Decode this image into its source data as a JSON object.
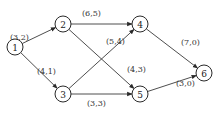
{
  "diagram": {
    "type": "directed-network",
    "nodes": [
      {
        "id": "1",
        "label": "1",
        "x": 15,
        "y": 47
      },
      {
        "id": "2",
        "label": "2",
        "x": 63,
        "y": 24
      },
      {
        "id": "3",
        "label": "3",
        "x": 63,
        "y": 94
      },
      {
        "id": "4",
        "label": "4",
        "x": 140,
        "y": 24
      },
      {
        "id": "5",
        "label": "5",
        "x": 140,
        "y": 94
      },
      {
        "id": "6",
        "label": "6",
        "x": 204,
        "y": 73
      }
    ],
    "edges": [
      {
        "from": "1",
        "to": "2",
        "label": "(3,2)",
        "lx": 10,
        "ly": 40
      },
      {
        "from": "1",
        "to": "3",
        "label": "(4,1)",
        "lx": 37,
        "ly": 74
      },
      {
        "from": "2",
        "to": "4",
        "label": "(6,5)",
        "lx": 82,
        "ly": 16
      },
      {
        "from": "2",
        "to": "5",
        "label": "(4,3)",
        "lx": 127,
        "ly": 72
      },
      {
        "from": "3",
        "to": "4",
        "label": "(5,4)",
        "lx": 106,
        "ly": 44
      },
      {
        "from": "3",
        "to": "5",
        "label": "(3,3)",
        "lx": 87,
        "ly": 106
      },
      {
        "from": "4",
        "to": "6",
        "label": "(7,0)",
        "lx": 181,
        "ly": 45
      },
      {
        "from": "5",
        "to": "6",
        "label": "(3,0)",
        "lx": 176,
        "ly": 86
      }
    ]
  }
}
